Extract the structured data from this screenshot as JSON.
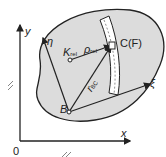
{
  "diagram": {
    "axes": {
      "x_label": "x",
      "y_label": "y",
      "origin_label": "0"
    },
    "body_axes": {
      "xi_label": "ξ",
      "eta_label": "η"
    },
    "points": {
      "B": "B",
      "C": "C(F)",
      "K": "K",
      "K_sub": "rel"
    },
    "vectors": {
      "rho": "ρ",
      "rho_sub": "rel",
      "r": "r",
      "r_sub": "BC"
    },
    "colors": {
      "body_fill": "#dcdcdc",
      "stroke": "#222222",
      "slot_fill": "#ffffff"
    }
  }
}
